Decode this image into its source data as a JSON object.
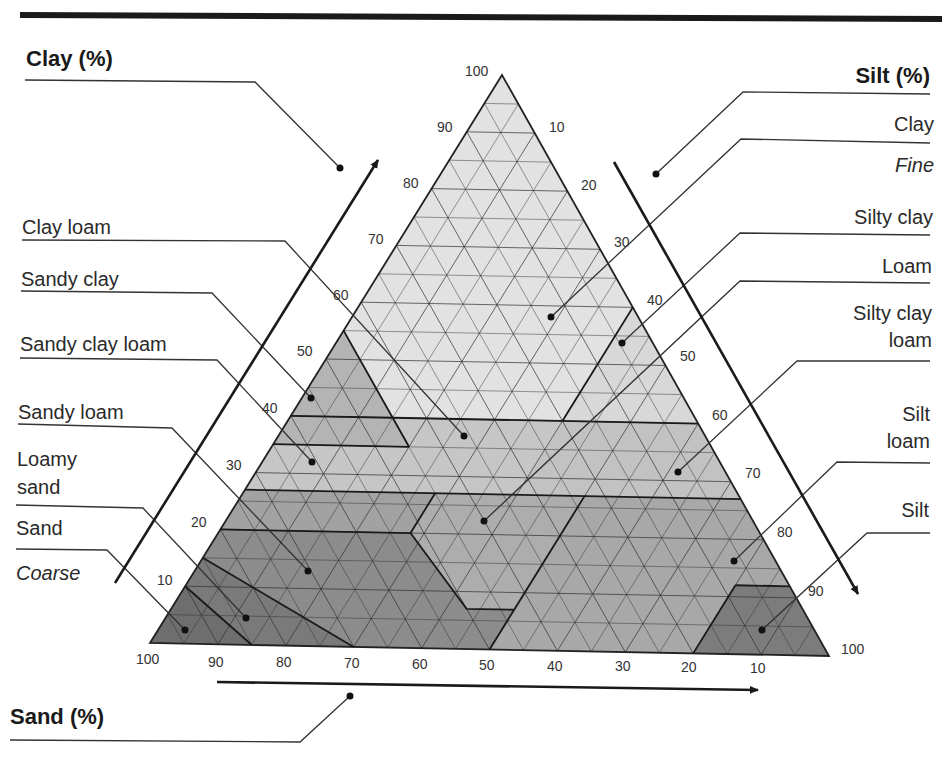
{
  "chart_data": {
    "type": "ternary",
    "axes": {
      "clay": {
        "label": "Clay (%)",
        "ticks": [
          10,
          20,
          30,
          40,
          50,
          60,
          70,
          80,
          90,
          100
        ],
        "side": "left",
        "direction": "increasing upward"
      },
      "silt": {
        "label": "Silt (%)",
        "ticks": [
          10,
          20,
          30,
          40,
          50,
          60,
          70,
          80,
          90,
          100
        ],
        "side": "right",
        "direction": "increasing downward"
      },
      "sand": {
        "label": "Sand (%)",
        "ticks": [
          100,
          90,
          80,
          70,
          60,
          50,
          40,
          30,
          20,
          10
        ],
        "side": "bottom",
        "direction": "decreasing left to right"
      }
    },
    "grid": true,
    "grid_step": 5,
    "texture_scale": {
      "coarse_label": "Coarse",
      "fine_label": "Fine"
    },
    "classes": [
      {
        "name": "Clay",
        "shade": "lightest"
      },
      {
        "name": "Silty clay",
        "shade": "light"
      },
      {
        "name": "Sandy clay",
        "shade": "medium"
      },
      {
        "name": "Clay loam",
        "shade": "medium-light"
      },
      {
        "name": "Silty clay loam",
        "shade": "medium-light"
      },
      {
        "name": "Sandy clay loam",
        "shade": "medium"
      },
      {
        "name": "Loam",
        "shade": "medium"
      },
      {
        "name": "Silt loam",
        "shade": "medium"
      },
      {
        "name": "Sandy loam",
        "shade": "dark"
      },
      {
        "name": "Silt",
        "shade": "dark"
      },
      {
        "name": "Loamy sand",
        "shade": "darker"
      },
      {
        "name": "Sand",
        "shade": "darkest"
      }
    ]
  },
  "labels": {
    "clay_axis": "Clay (%)",
    "silt_axis": "Silt (%)",
    "sand_axis": "Sand (%)",
    "left": {
      "clay_loam": "Clay loam",
      "sandy_clay": "Sandy clay",
      "sandy_clay_loam": "Sandy clay loam",
      "sandy_loam": "Sandy loam",
      "loamy_sand_1": "Loamy",
      "loamy_sand_2": "sand",
      "sand": "Sand",
      "coarse": "Coarse"
    },
    "right": {
      "clay": "Clay",
      "fine": "Fine",
      "silty_clay": "Silty clay",
      "loam": "Loam",
      "silty_clay_loam_1": "Silty clay",
      "silty_clay_loam_2": "loam",
      "silt_loam_1": "Silt",
      "silt_loam_2": "loam",
      "silt": "Silt"
    },
    "ticks": {
      "clay": [
        "100",
        "90",
        "80",
        "70",
        "60",
        "50",
        "40",
        "30",
        "20",
        "10"
      ],
      "silt": [
        "10",
        "20",
        "30",
        "40",
        "50",
        "60",
        "70",
        "80",
        "90",
        "100"
      ],
      "sand": [
        "100",
        "90",
        "80",
        "70",
        "60",
        "50",
        "40",
        "30",
        "20",
        "10"
      ]
    }
  },
  "colors": {
    "clay": "#e2e2e2",
    "silty_clay": "#d8d8d8",
    "clay_loam": "#c6c6c6",
    "sandy_clay": "#b4b4b4",
    "silty_clay_loam": "#c2c2c2",
    "sandy_clay_loam": "#a2a2a2",
    "loam": "#adadad",
    "silt_loam": "#a8a8a8",
    "sandy_loam": "#8c8c8c",
    "silt": "#7c7c7c",
    "loamy_sand": "#7a7a7a",
    "sand": "#6e6e6e",
    "grid": "#333333",
    "text": "#2a2a2a"
  }
}
